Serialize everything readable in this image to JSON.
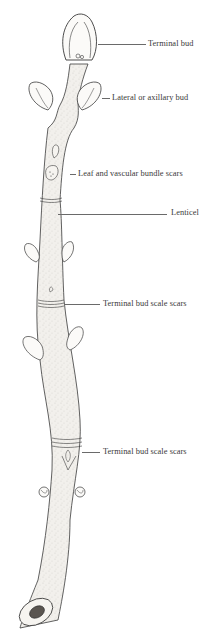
{
  "diagram": {
    "colors": {
      "background": "#ffffff",
      "ink": "#3a3a3a",
      "twig_fill": "#f2f0ec",
      "stipple": "#8a8580",
      "pith": "#5a5550"
    },
    "labels": [
      {
        "id": "terminal-bud",
        "text": "Terminal bud",
        "x": 148,
        "y": 39,
        "leader_from_x": 98,
        "leader_to_x": 146,
        "leader_y": 44
      },
      {
        "id": "lateral-bud",
        "text": "Lateral or axillary bud",
        "x": 112,
        "y": 93,
        "leader_from_x": 102,
        "leader_to_x": 110,
        "leader_y": 98
      },
      {
        "id": "leaf-scars",
        "text": "Leaf and vascular bundle scars",
        "x": 78,
        "y": 169,
        "leader_from_x": 70,
        "leader_to_x": 76,
        "leader_y": 174
      },
      {
        "id": "lenticel",
        "text": "Lenticel",
        "x": 171,
        "y": 208,
        "leader_from_x": 58,
        "leader_to_x": 167,
        "leader_y": 214
      },
      {
        "id": "bud-scale-scars-1",
        "text": "Terminal bud scale scars",
        "x": 103,
        "y": 299,
        "leader_from_x": 64,
        "leader_to_x": 100,
        "leader_y": 304
      },
      {
        "id": "bud-scale-scars-2",
        "text": "Terminal bud scale scars",
        "x": 103,
        "y": 447,
        "leader_from_x": 82,
        "leader_to_x": 100,
        "leader_y": 452
      }
    ]
  }
}
